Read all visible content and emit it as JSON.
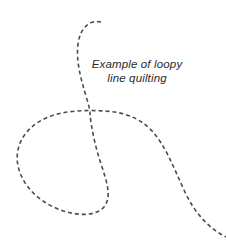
{
  "canvas": {
    "width": 226,
    "height": 242,
    "background_color": "#ffffff"
  },
  "caption": {
    "line1": "Example of loopy",
    "line2": "line quilting",
    "style": "italic",
    "align": "center",
    "color": "#2b2b2b",
    "font_size_px": 11.5
  },
  "drawing": {
    "name": "loopy-line-quilting-motif",
    "stroke_color": "#4a4a52",
    "stroke_width_px": 1.6,
    "dash_length_px": 4,
    "dash_gap_px": 3,
    "description": "Single dashed freehand meandering line forming one large teardrop loop with a crossing point, tail entering from top and exiting bottom right",
    "path": "M 101 22 C 90 19, 80 28, 78 44 C 76 60, 80 76, 86 96 C 89 106, 90 110, 90 114 C 91 126, 95 146, 101 164 C 107 182, 112 197, 104 207 C 95 217, 76 216, 58 209 C 38 201, 22 185, 18 166 C 14 146, 25 128, 44 119 C 62 110, 86 110, 105 111 C 124 112, 140 118, 152 131 C 165 145, 173 166, 184 190 C 194 212, 208 228, 226 237",
    "endpoints": {
      "start": {
        "x": 101,
        "y": 22
      },
      "crossing": {
        "x": 90,
        "y": 114
      },
      "end": {
        "x": 226,
        "y": 237
      }
    }
  }
}
